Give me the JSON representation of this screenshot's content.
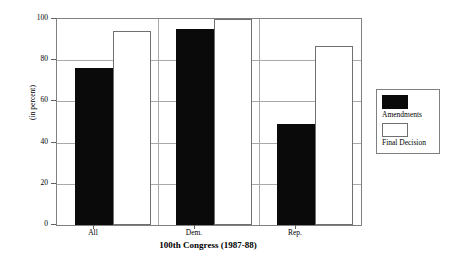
{
  "chart_data": {
    "type": "bar",
    "title": "",
    "categories": [
      "All",
      "Dem.",
      "Rep."
    ],
    "series": [
      {
        "name": "Amendments",
        "values": [
          76,
          95,
          49
        ]
      },
      {
        "name": "Final Decision",
        "values": [
          94,
          100,
          87
        ]
      }
    ],
    "xlabel": "100th Congress (1987-88)",
    "ylabel": "(in percent)",
    "ylim": [
      0,
      100
    ],
    "yticks": [
      0,
      20,
      40,
      60,
      80,
      100
    ],
    "ytick_labels": [
      "0",
      "20",
      "40",
      "60",
      "80",
      "100"
    ],
    "grid": true,
    "legend_position": "right",
    "colors": {
      "amendments": "#0a0a0a",
      "final_decision": "#ffffff",
      "bar_outline": "#707070",
      "gridline": "#a9a9a9",
      "frame": "#808080"
    }
  }
}
